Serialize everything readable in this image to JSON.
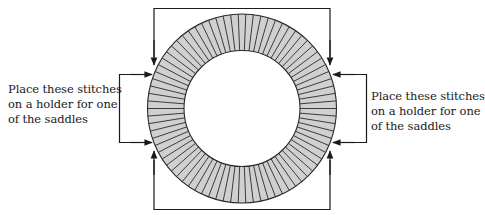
{
  "diagram": {
    "type": "knitting-yoke-ring",
    "ring": {
      "center_x": 242,
      "center_y": 108.5,
      "outer_radius": 94.5,
      "inner_radius": 58,
      "stitch_count": 78,
      "fill_color": "#d0d0d0",
      "stroke_color": "#2a2a2a"
    },
    "line_color": "#1a1a1a",
    "labels": {
      "left": {
        "line1": "Place these stitches",
        "line2": "on a holder for one",
        "line3": "of the saddles"
      },
      "right": {
        "line1": "Place these stitches",
        "line2": "on a holder for one",
        "line3": "of the saddles"
      }
    },
    "brackets": {
      "top": "top-bracket-arrows-down",
      "bottom": "bottom-bracket-arrows-up",
      "left": "left-bracket-arrows-right",
      "right": "right-bracket-arrows-left"
    }
  }
}
